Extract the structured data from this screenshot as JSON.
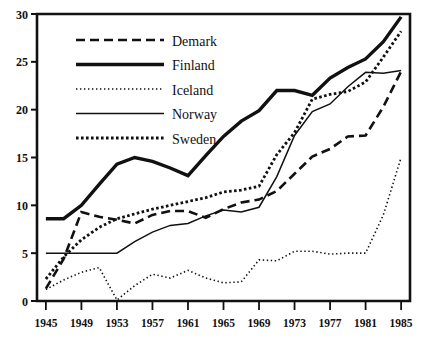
{
  "chart_data": {
    "type": "line",
    "title": "",
    "subtitle": "",
    "xlabel": "",
    "ylabel": "",
    "xlim": [
      1944,
      1986
    ],
    "ylim": [
      0,
      30
    ],
    "grid": false,
    "legend_position": "top-center",
    "x_ticks": [
      "1945",
      "1949",
      "1953",
      "1957",
      "1961",
      "1965",
      "1969",
      "1973",
      "1977",
      "1981",
      "1985"
    ],
    "x_tick_values": [
      1945,
      1949,
      1953,
      1957,
      1961,
      1965,
      1969,
      1973,
      1977,
      1981,
      1985
    ],
    "y_ticks": [
      "0",
      "5",
      "10",
      "15",
      "20",
      "25",
      "30"
    ],
    "y_tick_values": [
      0,
      5,
      10,
      15,
      20,
      25,
      30
    ],
    "series": [
      {
        "name": "Demark",
        "style": "dashed",
        "width": 2.6,
        "color": "#111111",
        "x": [
          1945,
          1947,
          1949,
          1951,
          1953,
          1955,
          1957,
          1959,
          1961,
          1963,
          1965,
          1967,
          1969,
          1971,
          1973,
          1975,
          1977,
          1979,
          1981,
          1983,
          1985
        ],
        "values": [
          1.3,
          4.4,
          9.3,
          8.8,
          8.5,
          8.1,
          9.0,
          9.4,
          9.4,
          8.7,
          9.6,
          10.3,
          10.6,
          11.5,
          13.3,
          15.1,
          15.9,
          17.2,
          17.3,
          20.3,
          24.0
        ]
      },
      {
        "name": "Finland",
        "style": "solid-thick",
        "width": 3.4,
        "color": "#111111",
        "x": [
          1945,
          1947,
          1949,
          1951,
          1953,
          1955,
          1957,
          1959,
          1961,
          1963,
          1965,
          1967,
          1969,
          1971,
          1973,
          1975,
          1977,
          1979,
          1981,
          1983,
          1985
        ],
        "values": [
          8.6,
          8.6,
          10.0,
          12.2,
          14.3,
          15.0,
          14.6,
          13.9,
          13.1,
          15.2,
          17.2,
          18.8,
          19.9,
          22.0,
          22.0,
          21.5,
          23.3,
          24.4,
          25.3,
          27.1,
          29.7
        ]
      },
      {
        "name": "Iceland",
        "style": "dotted-fine",
        "width": 1.6,
        "color": "#111111",
        "x": [
          1945,
          1947,
          1949,
          1951,
          1953,
          1955,
          1957,
          1959,
          1961,
          1963,
          1965,
          1967,
          1969,
          1971,
          1973,
          1975,
          1977,
          1979,
          1981,
          1983,
          1985
        ],
        "values": [
          1.2,
          2.2,
          3.0,
          3.5,
          0.1,
          1.6,
          2.8,
          2.4,
          3.2,
          2.4,
          1.9,
          2.0,
          4.3,
          4.2,
          5.2,
          5.2,
          4.9,
          5.0,
          5.0,
          9.0,
          15.0
        ]
      },
      {
        "name": "Norway",
        "style": "solid-thin",
        "width": 1.5,
        "color": "#111111",
        "x": [
          1945,
          1947,
          1949,
          1951,
          1953,
          1955,
          1957,
          1959,
          1961,
          1963,
          1965,
          1967,
          1969,
          1971,
          1973,
          1975,
          1977,
          1979,
          1981,
          1983,
          1985
        ],
        "values": [
          5.0,
          5.0,
          5.0,
          5.0,
          5.0,
          6.2,
          7.2,
          7.9,
          8.1,
          8.9,
          9.5,
          9.3,
          9.8,
          13.0,
          17.3,
          19.8,
          20.6,
          22.4,
          23.9,
          23.8,
          24.1
        ]
      },
      {
        "name": "Sweden",
        "style": "dotted-thick",
        "width": 2.8,
        "color": "#111111",
        "x": [
          1945,
          1947,
          1949,
          1951,
          1953,
          1955,
          1957,
          1959,
          1961,
          1963,
          1965,
          1967,
          1969,
          1971,
          1973,
          1975,
          1977,
          1979,
          1981,
          1983,
          1985
        ],
        "values": [
          2.3,
          4.6,
          6.4,
          7.7,
          8.6,
          9.1,
          9.6,
          10.0,
          10.4,
          10.8,
          11.4,
          11.6,
          12.0,
          15.3,
          17.6,
          21.1,
          21.6,
          21.9,
          22.9,
          25.5,
          28.2
        ]
      }
    ],
    "legend": [
      {
        "label": "Demark",
        "style": "dashed"
      },
      {
        "label": "Finland",
        "style": "solid-thick"
      },
      {
        "label": "Iceland",
        "style": "dotted-fine"
      },
      {
        "label": "Norway",
        "style": "solid-thin"
      },
      {
        "label": "Sweden",
        "style": "dotted-thick"
      }
    ],
    "axis_color": "#111111"
  }
}
